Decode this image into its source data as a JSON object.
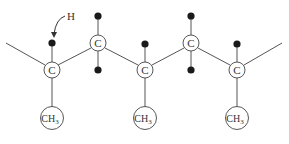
{
  "diagram": {
    "annotation_label": "H",
    "colors": {
      "bond": "#555555",
      "atom_ring": "#444444",
      "hydrogen": "#1a1a1a",
      "text": "#333333"
    },
    "backbone_carbons": [
      {
        "id": "c1",
        "label": "C",
        "x": 52,
        "y": 70,
        "position": "low",
        "hydrogens": [
          {
            "x": 52,
            "y": 44
          }
        ],
        "substituent": {
          "label": "CH",
          "sub": "3",
          "x": 52,
          "y": 118
        }
      },
      {
        "id": "c2",
        "label": "C",
        "x": 98,
        "y": 43,
        "position": "high",
        "hydrogens": [
          {
            "x": 98,
            "y": 16
          },
          {
            "x": 98,
            "y": 70
          }
        ],
        "substituent": null
      },
      {
        "id": "c3",
        "label": "C",
        "x": 145,
        "y": 70,
        "position": "low",
        "hydrogens": [
          {
            "x": 145,
            "y": 44
          }
        ],
        "substituent": {
          "label": "CH",
          "sub": "3",
          "x": 145,
          "y": 118
        }
      },
      {
        "id": "c4",
        "label": "C",
        "x": 191,
        "y": 43,
        "position": "high",
        "hydrogens": [
          {
            "x": 191,
            "y": 16
          },
          {
            "x": 191,
            "y": 70
          }
        ],
        "substituent": null
      },
      {
        "id": "c5",
        "label": "C",
        "x": 237,
        "y": 70,
        "position": "low",
        "hydrogens": [
          {
            "x": 237,
            "y": 44
          }
        ],
        "substituent": {
          "label": "CH",
          "sub": "3",
          "x": 237,
          "y": 118
        }
      }
    ],
    "chain_ends": {
      "left": {
        "x": 6,
        "y": 43
      },
      "right": {
        "x": 282,
        "y": 43
      }
    }
  }
}
